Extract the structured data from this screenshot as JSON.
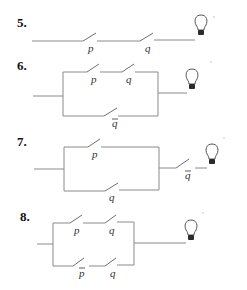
{
  "problems": [
    {
      "number": "5.",
      "description": "Series circuit: switch p then switch q to bulb",
      "switches": [
        {
          "label": "p",
          "negated": false
        },
        {
          "label": "q",
          "negated": false
        }
      ]
    },
    {
      "number": "6.",
      "description": "Parallel: (p and q) in upper branch, q-bar in lower branch, to bulb",
      "branches": [
        [
          {
            "label": "p",
            "negated": false
          },
          {
            "label": "q",
            "negated": false
          }
        ],
        [
          {
            "label": "q",
            "negated": true
          }
        ]
      ]
    },
    {
      "number": "7.",
      "description": "Parallel: p upper, q lower, then series q-bar to bulb",
      "branches": [
        [
          {
            "label": "p",
            "negated": false
          }
        ],
        [
          {
            "label": "q",
            "negated": false
          }
        ]
      ],
      "series_after": [
        {
          "label": "q",
          "negated": true
        }
      ]
    },
    {
      "number": "8.",
      "description": "Parallel: (p and q) upper, (p-bar and q) lower, to bulb",
      "branches": [
        [
          {
            "label": "p",
            "negated": false
          },
          {
            "label": "q",
            "negated": false
          }
        ],
        [
          {
            "label": "p",
            "negated": true
          },
          {
            "label": "q",
            "negated": false
          }
        ]
      ]
    }
  ],
  "labels": {
    "p5_num": "5.",
    "p5_s1": "p",
    "p5_s2": "q",
    "p6_num": "6.",
    "p6_s1": "p",
    "p6_s2": "q",
    "p6_s3": "q",
    "p7_num": "7.",
    "p7_s1": "p",
    "p7_s2": "q",
    "p7_s3": "q",
    "p8_num": "8.",
    "p8_s1": "p",
    "p8_s2": "q",
    "p8_s3": "p",
    "p8_s4": "q"
  },
  "colors": {
    "wire": "#8a8a8a",
    "text": "#111111",
    "bulb_base": "#2b2b2b"
  }
}
